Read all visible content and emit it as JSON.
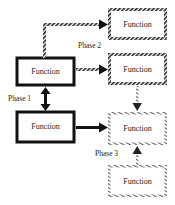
{
  "diagram": {
    "nodes": [
      {
        "id": "left-top",
        "label": "Function",
        "style": "solid-bold"
      },
      {
        "id": "left-bottom",
        "label": "Function",
        "style": "solid-bold"
      },
      {
        "id": "right-top",
        "label": "Function",
        "style": "hatched-dark"
      },
      {
        "id": "right-mid",
        "label": "Function",
        "style": "hatched-dark"
      },
      {
        "id": "right-lower",
        "label": "Function",
        "style": "hatched-light"
      },
      {
        "id": "right-bottom",
        "label": "Function",
        "style": "hatched-light"
      }
    ],
    "phases": {
      "phase1": "Phase 1",
      "phase2": "Phase 2",
      "phase3": "Phase 3"
    },
    "edges": [
      {
        "from": "left-top",
        "to": "right-top",
        "style": "hatched-dark"
      },
      {
        "from": "left-top",
        "to": "right-mid",
        "style": "hatched-dark"
      },
      {
        "from": "left-top",
        "to": "left-bottom",
        "style": "solid-bidirectional"
      },
      {
        "from": "left-bottom",
        "to": "right-lower",
        "style": "solid"
      },
      {
        "from": "right-mid",
        "to": "right-lower",
        "style": "hatched-light"
      },
      {
        "from": "right-bottom",
        "to": "right-lower",
        "style": "hatched-light"
      }
    ]
  }
}
